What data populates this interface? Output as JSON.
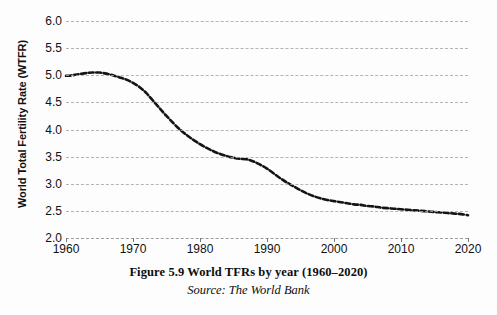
{
  "chart_data": {
    "type": "line",
    "title": "",
    "xlabel": "",
    "ylabel": "World Total Fertility Rate (WTFR)",
    "xlim": [
      1960,
      2020
    ],
    "ylim": [
      2.0,
      6.0
    ],
    "grid": true,
    "legend_position": "none",
    "line_style": "dashed",
    "line_color": "#141414",
    "y_ticks": [
      "6.0",
      "5.5",
      "5.0",
      "4.5",
      "4.0",
      "3.5",
      "3.0",
      "2.5",
      "2.0"
    ],
    "x_ticks": [
      "1960",
      "1970",
      "1980",
      "1990",
      "2000",
      "2010",
      "2020"
    ],
    "series": [
      {
        "name": "World Total Fertility Rate",
        "x": [
          1960,
          1961,
          1962,
          1963,
          1964,
          1965,
          1966,
          1967,
          1968,
          1969,
          1970,
          1971,
          1972,
          1973,
          1974,
          1975,
          1976,
          1977,
          1978,
          1979,
          1980,
          1981,
          1982,
          1983,
          1984,
          1985,
          1986,
          1987,
          1988,
          1989,
          1990,
          1991,
          1992,
          1993,
          1994,
          1995,
          1996,
          1997,
          1998,
          1999,
          2000,
          2001,
          2002,
          2003,
          2004,
          2005,
          2006,
          2007,
          2008,
          2009,
          2010,
          2011,
          2012,
          2013,
          2014,
          2015,
          2016,
          2017,
          2018,
          2019,
          2020
        ],
        "values": [
          4.99,
          5.0,
          5.02,
          5.04,
          5.05,
          5.05,
          5.03,
          5.0,
          4.96,
          4.92,
          4.86,
          4.78,
          4.67,
          4.53,
          4.39,
          4.25,
          4.12,
          4.0,
          3.9,
          3.81,
          3.73,
          3.66,
          3.6,
          3.55,
          3.51,
          3.48,
          3.46,
          3.45,
          3.41,
          3.35,
          3.28,
          3.19,
          3.1,
          3.02,
          2.95,
          2.88,
          2.82,
          2.77,
          2.73,
          2.7,
          2.68,
          2.66,
          2.64,
          2.62,
          2.61,
          2.59,
          2.58,
          2.56,
          2.55,
          2.54,
          2.53,
          2.52,
          2.51,
          2.5,
          2.49,
          2.48,
          2.47,
          2.46,
          2.45,
          2.44,
          2.42
        ]
      }
    ]
  },
  "figure": {
    "caption": "Figure 5.9 World TFRs by year (1960–2020)",
    "source": "Source: The World Bank"
  }
}
